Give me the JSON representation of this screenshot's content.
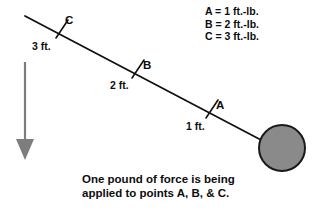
{
  "figure": {
    "background_color": "#ffffff",
    "line_color": "#111111",
    "ball_fill_color": "#8a8a8a",
    "ball_stroke_color": "#1a1a1a",
    "arrow_color": "#7d7d7d"
  },
  "legend": {
    "entries": [
      {
        "text": "A = 1 ft.-lb."
      },
      {
        "text": "B = 2 ft.-lb."
      },
      {
        "text": "C = 3 ft.-lb."
      }
    ]
  },
  "caption": {
    "lines": [
      "One pound of force is being",
      "applied to points A, B, & C."
    ]
  },
  "points": [
    {
      "id": "A",
      "label": "A",
      "distance_label": "1 ft.",
      "torque": "1 ft.-lb."
    },
    {
      "id": "B",
      "label": "B",
      "distance_label": "2 ft.",
      "torque": "2 ft.-lb."
    },
    {
      "id": "C",
      "label": "C",
      "distance_label": "3 ft.",
      "torque": "3 ft.-lb."
    }
  ],
  "icons": {
    "force_arrow": "down-arrow-icon",
    "ball": "circle-mass-icon",
    "lever": "lever-line-icon",
    "tick": "tick-mark-icon"
  }
}
